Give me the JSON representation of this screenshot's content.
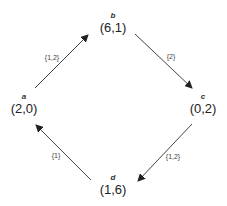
{
  "diagram": {
    "type": "directed-cycle",
    "colors": {
      "edge": "#444444",
      "text": "#222222",
      "background": "#ffffff"
    },
    "nodes": [
      {
        "id": "a",
        "name": "a",
        "payoff": "(2,0)",
        "x": 24,
        "y": 93
      },
      {
        "id": "b",
        "name": "b",
        "payoff": "(6,1)",
        "x": 113,
        "y": 12
      },
      {
        "id": "c",
        "name": "c",
        "payoff": "(0,2)",
        "x": 203,
        "y": 93
      },
      {
        "id": "d",
        "name": "d",
        "payoff": "(1,6)",
        "x": 113,
        "y": 174
      }
    ],
    "edges": [
      {
        "from": "a",
        "to": "b",
        "label": "{1,2}",
        "x1": 35,
        "y1": 88,
        "x2": 88,
        "y2": 35,
        "lx": 52,
        "ly": 57
      },
      {
        "from": "b",
        "to": "c",
        "label": "{2}",
        "x1": 135,
        "y1": 34,
        "x2": 192,
        "y2": 88,
        "lx": 171,
        "ly": 56
      },
      {
        "from": "c",
        "to": "d",
        "label": "{1,2}",
        "x1": 192,
        "y1": 124,
        "x2": 138,
        "y2": 181,
        "lx": 173,
        "ly": 156
      },
      {
        "from": "d",
        "to": "a",
        "label": "{1}",
        "x1": 91,
        "y1": 180,
        "x2": 36,
        "y2": 125,
        "lx": 56,
        "ly": 155
      }
    ]
  }
}
